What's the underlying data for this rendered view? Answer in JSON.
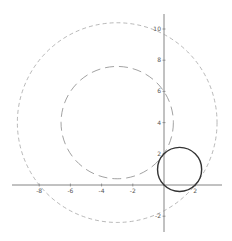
{
  "chart_data": {
    "type": "line",
    "title": "",
    "xlabel": "",
    "ylabel": "",
    "xlim": [
      -9.5,
      4.5
    ],
    "ylim": [
      -3.5,
      11
    ],
    "grid": false,
    "legend": null,
    "x_ticks": [
      -8,
      -6,
      -4,
      -2,
      2
    ],
    "y_ticks": [
      10,
      8,
      6,
      4,
      2,
      -2
    ],
    "x_tick_labels": [
      "-8",
      "-6",
      "-4",
      "-2",
      "2"
    ],
    "y_tick_labels": [
      "10",
      "8",
      "6",
      "4",
      "2",
      "-2"
    ],
    "series": [
      {
        "name": "outer-dashed-circle",
        "shape": "circle",
        "center": [
          -3,
          4
        ],
        "radius": 6.4,
        "style": "dashed",
        "color": "#9a9a9a"
      },
      {
        "name": "inner-dashed-circle",
        "shape": "circle",
        "center": [
          -3,
          4
        ],
        "radius": 3.6,
        "style": "long-dashed",
        "color": "#8a8a8a"
      },
      {
        "name": "solid-circle",
        "shape": "circle",
        "center": [
          1,
          1
        ],
        "radius": 1.414,
        "style": "solid",
        "color": "#333333"
      }
    ]
  },
  "layout": {
    "origin_px": [
      164,
      185
    ],
    "px_per_unit": 15.6,
    "axis_color": "#666666"
  }
}
